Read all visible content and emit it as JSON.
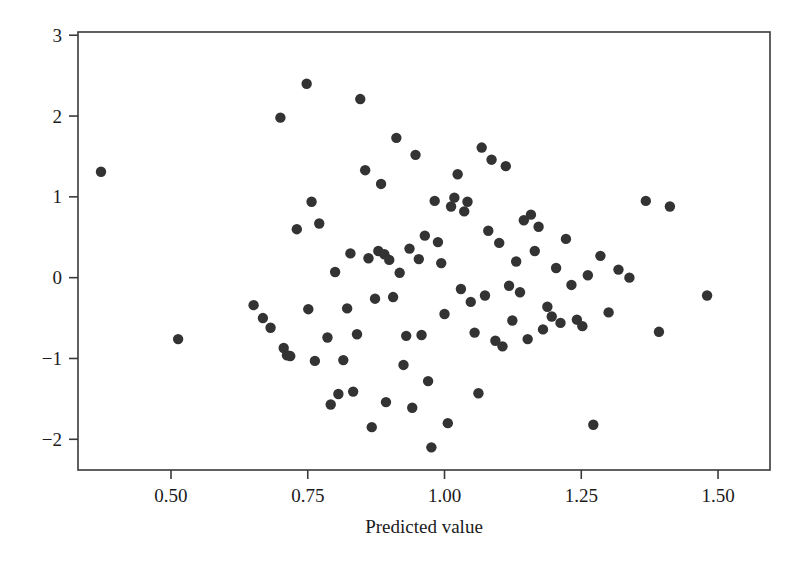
{
  "figure": {
    "background_color": "#ffffff",
    "frame_color": "#3a3a3a",
    "point_color": "#333333",
    "point_radius_px": 5.2
  },
  "axis_titles": {
    "x": "Predicted value",
    "y": ""
  },
  "chart_data": {
    "type": "scatter",
    "title": "",
    "subtitle": "",
    "xlabel": "Predicted value",
    "ylabel": "",
    "xlim": [
      0.33,
      1.595
    ],
    "ylim": [
      -2.38,
      3.04
    ],
    "xticks": [
      0.5,
      0.75,
      1.0,
      1.25,
      1.5
    ],
    "xtick_labels": [
      "0.50",
      "0.75",
      "1.00",
      "1.25",
      "1.50"
    ],
    "yticks": [
      -2,
      -1,
      0,
      1,
      2,
      3
    ],
    "ytick_labels": [
      "-2",
      "-1",
      "0",
      "1",
      "2",
      "3"
    ],
    "grid": false,
    "legend": null,
    "annotations": [],
    "marker": "filled-circle",
    "series": [
      {
        "name": "residuals",
        "x": [
          0.372,
          0.513,
          0.651,
          0.668,
          0.682,
          0.7,
          0.706,
          0.712,
          0.718,
          0.73,
          0.748,
          0.751,
          0.757,
          0.763,
          0.771,
          0.786,
          0.792,
          0.8,
          0.806,
          0.815,
          0.822,
          0.828,
          0.833,
          0.84,
          0.846,
          0.855,
          0.861,
          0.867,
          0.873,
          0.879,
          0.884,
          0.89,
          0.893,
          0.899,
          0.906,
          0.912,
          0.918,
          0.925,
          0.93,
          0.936,
          0.941,
          0.947,
          0.953,
          0.958,
          0.964,
          0.97,
          0.976,
          0.982,
          0.988,
          0.994,
          1.0,
          1.006,
          1.012,
          1.018,
          1.024,
          1.03,
          1.036,
          1.042,
          1.048,
          1.055,
          1.062,
          1.068,
          1.074,
          1.08,
          1.086,
          1.093,
          1.1,
          1.106,
          1.112,
          1.118,
          1.124,
          1.131,
          1.138,
          1.145,
          1.152,
          1.158,
          1.165,
          1.172,
          1.18,
          1.188,
          1.196,
          1.204,
          1.212,
          1.222,
          1.232,
          1.242,
          1.252,
          1.262,
          1.272,
          1.285,
          1.3,
          1.318,
          1.338,
          1.368,
          1.392,
          1.412,
          1.48
        ],
        "y": [
          1.31,
          -0.76,
          -0.34,
          -0.5,
          -0.62,
          1.98,
          -0.87,
          -0.96,
          -0.97,
          0.6,
          2.4,
          -0.39,
          0.94,
          -1.03,
          0.67,
          -0.74,
          -1.57,
          0.07,
          -1.44,
          -1.02,
          -0.38,
          0.3,
          -1.41,
          -0.7,
          2.21,
          1.33,
          0.24,
          -1.85,
          -0.26,
          0.33,
          1.16,
          0.29,
          -1.54,
          0.22,
          -0.24,
          1.73,
          0.06,
          -1.08,
          -0.72,
          0.36,
          -1.61,
          1.52,
          0.23,
          -0.71,
          0.52,
          -1.28,
          -2.1,
          0.95,
          0.44,
          0.18,
          -0.45,
          -1.8,
          0.88,
          0.99,
          1.28,
          -0.14,
          0.82,
          0.94,
          -0.3,
          -0.68,
          -1.43,
          1.61,
          -0.22,
          0.58,
          1.46,
          -0.78,
          0.43,
          -0.85,
          1.38,
          -0.1,
          -0.53,
          0.2,
          -0.18,
          0.71,
          -0.76,
          0.78,
          0.33,
          0.63,
          -0.64,
          -0.36,
          -0.48,
          0.12,
          -0.56,
          0.48,
          -0.09,
          -0.52,
          -0.6,
          0.03,
          -1.82,
          0.27,
          -0.43,
          0.1,
          0.0,
          0.95,
          -0.67,
          0.88,
          -0.22
        ]
      }
    ]
  }
}
